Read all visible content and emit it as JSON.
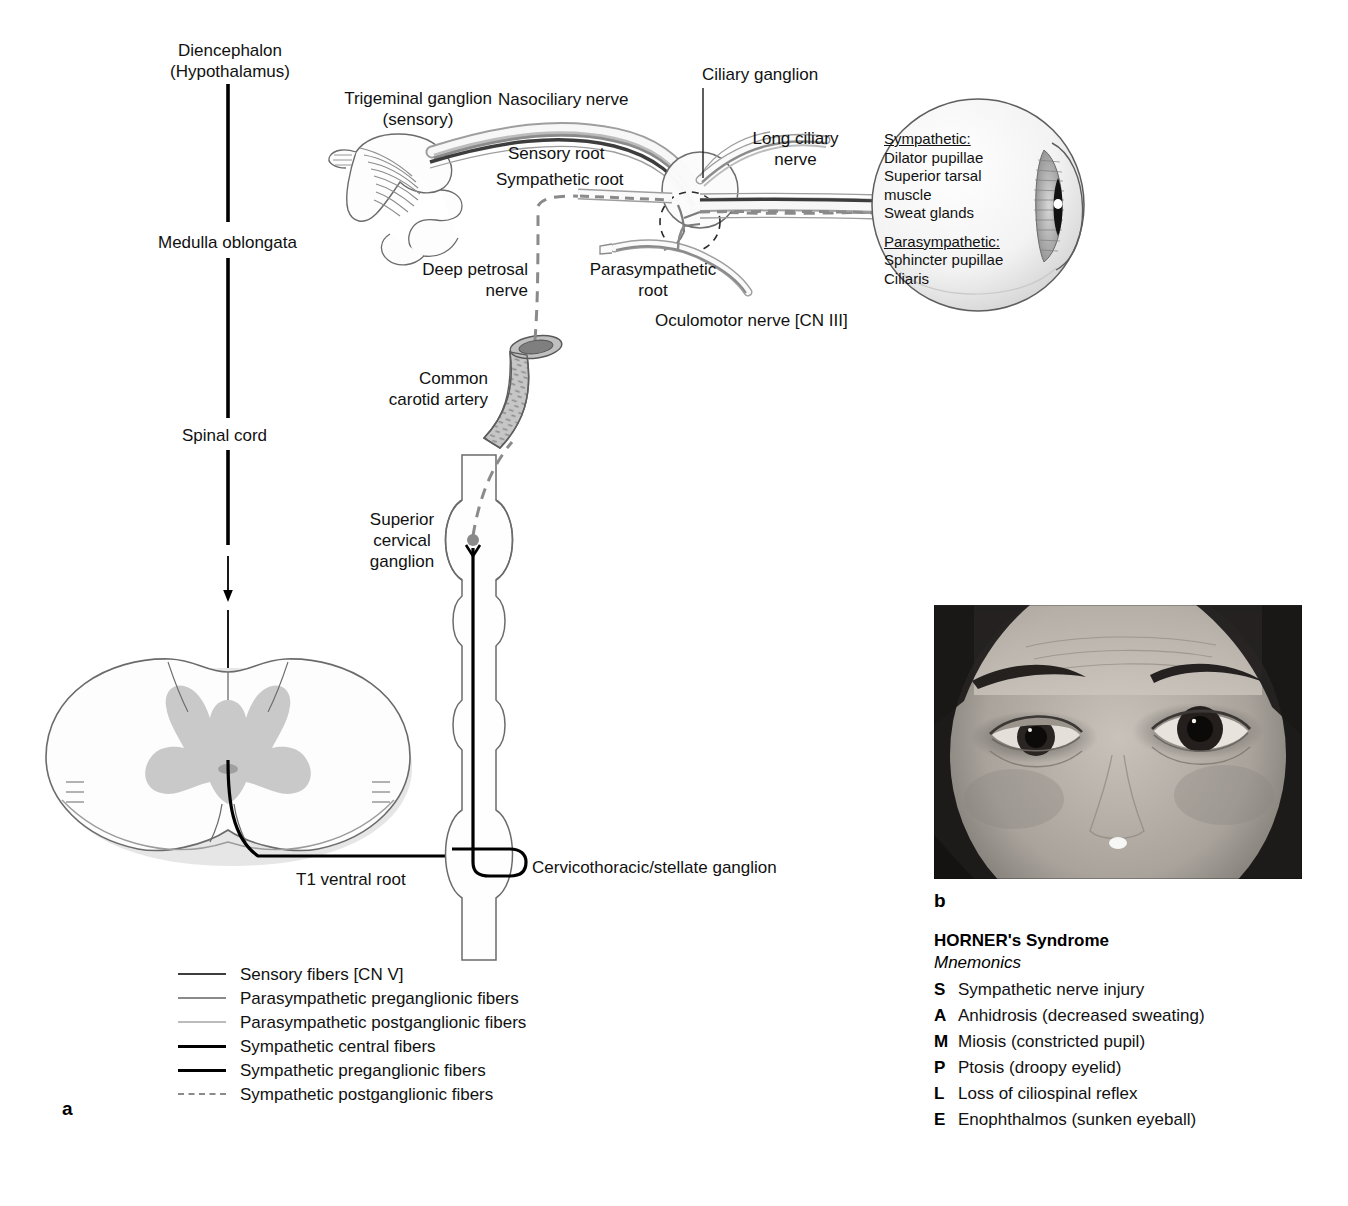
{
  "figure": {
    "panel_a_letter": "a",
    "panel_b_letter": "b"
  },
  "diagram_labels": {
    "diencephalon": "Diencephalon\n(Hypothalamus)",
    "medulla": "Medulla oblongata",
    "spinal_cord": "Spinal cord",
    "trigeminal_ganglion": "Trigeminal ganglion\n(sensory)",
    "nasociliary_nerve": "Nasociliary nerve",
    "ciliary_ganglion": "Ciliary ganglion",
    "long_ciliary_nerve": "Long ciliary\nnerve",
    "sensory_root": "Sensory root",
    "sympathetic_root": "Sympathetic root",
    "deep_petrosal_nerve": "Deep petrosal\nnerve",
    "parasympathetic_root": "Parasympathetic\nroot",
    "oculomotor_nerve": "Oculomotor nerve [CN III]",
    "common_carotid_artery": "Common\ncarotid artery",
    "superior_cervical_ganglion": "Superior\ncervical\nganglion",
    "t1_ventral_root": "T1 ventral root",
    "cervicothoracic_ganglion": "Cervicothoracic/stellate ganglion"
  },
  "eye_callout": {
    "sympathetic_heading": "Sympathetic:",
    "sympathetic_items": [
      "Dilator pupillae",
      "Superior tarsal",
      "muscle",
      "Sweat glands"
    ],
    "parasympathetic_heading": "Parasympathetic:",
    "parasympathetic_items": [
      "Sphincter pupillae",
      "Ciliaris"
    ]
  },
  "legend": {
    "items": [
      {
        "label": "Sensory fibers [CN V]",
        "color": "#3d3d3d",
        "style": "solid",
        "width": 2.5
      },
      {
        "label": "Parasympathetic preganglionic fibers",
        "color": "#8a8a8a",
        "style": "solid",
        "width": 2.5
      },
      {
        "label": "Parasympathetic postganglionic fibers",
        "color": "#bcbcbc",
        "style": "solid",
        "width": 2.5
      },
      {
        "label": "Sympathetic central fibers",
        "color": "#000000",
        "style": "solid",
        "width": 3.5
      },
      {
        "label": "Sympathetic preganglionic fibers",
        "color": "#000000",
        "style": "solid",
        "width": 3.5
      },
      {
        "label": "Sympathetic postganglionic fibers",
        "color": "#8a8a8a",
        "style": "dashed",
        "width": 2.5
      }
    ]
  },
  "mnemonics": {
    "title": "HORNER's Syndrome",
    "subtitle": "Mnemonics",
    "rows": [
      {
        "key": "S",
        "text": "Sympathetic nerve injury"
      },
      {
        "key": "A",
        "text": "Anhidrosis (decreased sweating)"
      },
      {
        "key": "M",
        "text": "Miosis (constricted pupil)"
      },
      {
        "key": "P",
        "text": "Ptosis (droopy eyelid)"
      },
      {
        "key": "L",
        "text": "Loss of ciliospinal reflex"
      },
      {
        "key": "E",
        "text": "Enophthalmos (sunken eyeball)"
      }
    ]
  },
  "colors": {
    "sympathetic_central": "#000000",
    "sympathetic_postganglionic": "#8a8a8a",
    "sensory": "#3d3d3d",
    "parasympathetic_pre": "#8a8a8a",
    "parasympathetic_post": "#bcbcbc",
    "outline": "#5a5a5a",
    "gray_matter": "#c9c9c9"
  }
}
